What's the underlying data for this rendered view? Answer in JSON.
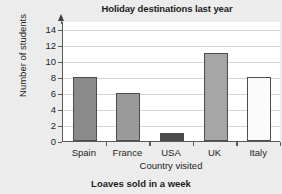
{
  "chart_data": {
    "type": "bar",
    "title": "Holiday destinations last year",
    "xlabel": "Country visited",
    "ylabel": "Number of students",
    "categories": [
      "Spain",
      "France",
      "USA",
      "UK",
      "Italy"
    ],
    "values": [
      8,
      6,
      1,
      11,
      8
    ],
    "yticks": [
      0,
      2,
      4,
      6,
      8,
      10,
      12,
      14
    ],
    "ylim": [
      0,
      15
    ],
    "grid": "horizontal",
    "legend": "none",
    "bar_colors": [
      "#8a8a8a",
      "#9a9a9a",
      "#4a4a4a",
      "#a6a6a6",
      "#fbfbfb"
    ],
    "bar_edge_color": "#4d4d4d"
  },
  "figure": {
    "background_color": "#ececec",
    "plot_background_color": "#ffffff",
    "axis_color": "#5a5a5a",
    "gridline_color": "#d3d3d3",
    "text_color": "#1c1c1c"
  },
  "next_chart": {
    "caption": "Loaves sold in a week"
  }
}
